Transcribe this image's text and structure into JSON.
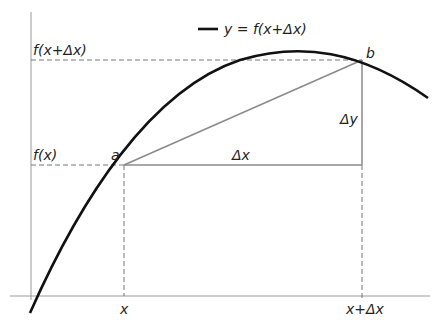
{
  "diagram": {
    "legend": {
      "label": "y = f(x+Δx)",
      "line_color": "#111111"
    },
    "curve": {
      "color": "#111111",
      "width": 2.6
    },
    "secant": {
      "color": "#8a8a8a"
    },
    "axes_color": "#999999",
    "guide_color": "#777777",
    "points": {
      "a": {
        "label": "a",
        "x": 124,
        "y": 165
      },
      "b": {
        "label": "b",
        "x": 362,
        "y": 60
      }
    },
    "labels": {
      "fx": "f(x)",
      "fxdx": "f(x+Δx)",
      "x": "x",
      "xdx": "x+Δx",
      "dx": "Δx",
      "dy": "Δy"
    }
  }
}
